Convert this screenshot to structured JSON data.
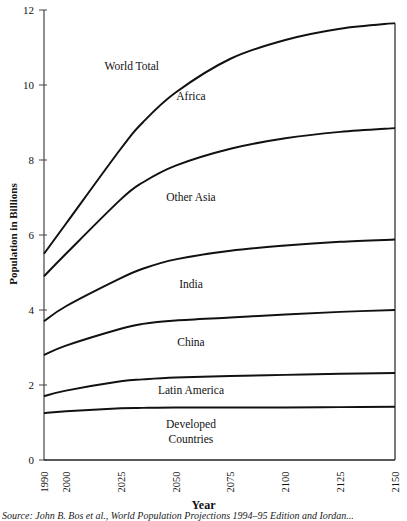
{
  "chart_data": {
    "type": "area",
    "stacked": true,
    "title": "",
    "xlabel": "Year",
    "ylabel": "Population in Billions",
    "ylim": [
      0,
      12
    ],
    "xlim": [
      1990,
      2150
    ],
    "y_ticks": [
      0,
      2,
      4,
      6,
      8,
      10,
      12
    ],
    "x_ticks": [
      1990,
      2000,
      2025,
      2050,
      2075,
      2100,
      2125,
      2150
    ],
    "grid": false,
    "legend": "inline labels",
    "x": [
      1990,
      2000,
      2025,
      2035,
      2050,
      2075,
      2100,
      2125,
      2150
    ],
    "cumulative_boundaries": [
      {
        "name": "Developed Countries",
        "values": [
          1.25,
          1.3,
          1.38,
          1.39,
          1.4,
          1.4,
          1.4,
          1.41,
          1.42
        ]
      },
      {
        "name": "Latin America",
        "values": [
          1.7,
          1.85,
          2.1,
          2.15,
          2.2,
          2.24,
          2.27,
          2.3,
          2.32
        ]
      },
      {
        "name": "China",
        "values": [
          2.8,
          3.05,
          3.5,
          3.63,
          3.72,
          3.8,
          3.88,
          3.95,
          4.0
        ]
      },
      {
        "name": "India",
        "values": [
          3.7,
          4.1,
          4.85,
          5.1,
          5.35,
          5.58,
          5.72,
          5.82,
          5.88
        ]
      },
      {
        "name": "Other Asia",
        "values": [
          4.9,
          5.5,
          6.95,
          7.4,
          7.85,
          8.3,
          8.58,
          8.75,
          8.85
        ]
      },
      {
        "name": "World Total",
        "values": [
          5.5,
          6.3,
          8.3,
          9.0,
          9.8,
          10.7,
          11.2,
          11.5,
          11.65
        ]
      }
    ],
    "series": [
      {
        "name": "Developed Countries",
        "values": [
          1.25,
          1.3,
          1.38,
          1.39,
          1.4,
          1.4,
          1.4,
          1.41,
          1.42
        ]
      },
      {
        "name": "Latin America",
        "values": [
          0.45,
          0.55,
          0.72,
          0.76,
          0.8,
          0.84,
          0.87,
          0.89,
          0.9
        ]
      },
      {
        "name": "China",
        "values": [
          1.1,
          1.2,
          1.4,
          1.48,
          1.52,
          1.56,
          1.61,
          1.65,
          1.68
        ]
      },
      {
        "name": "India",
        "values": [
          0.9,
          1.05,
          1.35,
          1.47,
          1.63,
          1.78,
          1.84,
          1.87,
          1.88
        ]
      },
      {
        "name": "Other Asia",
        "values": [
          1.2,
          1.4,
          2.1,
          2.3,
          2.5,
          2.72,
          2.86,
          2.93,
          2.97
        ]
      },
      {
        "name": "Africa",
        "values": [
          0.6,
          0.8,
          1.35,
          1.6,
          1.95,
          2.4,
          2.62,
          2.75,
          2.8
        ]
      }
    ],
    "region_labels": [
      {
        "text": "World Total",
        "x": 2030,
        "y": 10.4
      },
      {
        "text": "Africa",
        "x": 2057,
        "y": 9.6
      },
      {
        "text": "Other Asia",
        "x": 2057,
        "y": 6.9
      },
      {
        "text": "India",
        "x": 2057,
        "y": 4.6
      },
      {
        "text": "China",
        "x": 2057,
        "y": 3.05
      },
      {
        "text": "Latin America",
        "x": 2057,
        "y": 1.75
      },
      {
        "text": "Developed",
        "x": 2057,
        "y": 0.85
      },
      {
        "text": "Countries",
        "x": 2057,
        "y": 0.45
      }
    ]
  },
  "axes": {
    "ylabel": "Population in Billions",
    "xlabel": "Year"
  },
  "source_note": "Source: John B. Bos et al., World Population Projections 1994–95 Edition and Iordan..."
}
